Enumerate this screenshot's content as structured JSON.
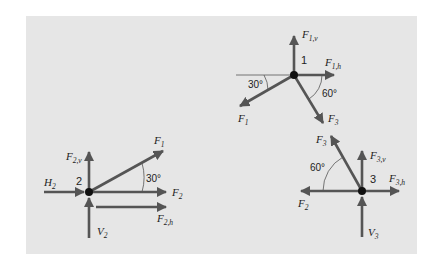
{
  "colors": {
    "background": "#ffffff",
    "panel": "#e6e6e6",
    "arrow": "#555555",
    "node": "#111111",
    "text": "#222222"
  },
  "nodes": [
    {
      "id": "1",
      "label": "1"
    },
    {
      "id": "2",
      "label": "2"
    },
    {
      "id": "3",
      "label": "3"
    }
  ],
  "node1": {
    "number": "1",
    "forces": {
      "F1v": {
        "main": "F",
        "sub": "1,v"
      },
      "F1h": {
        "main": "F",
        "sub": "1,h"
      },
      "F1": {
        "main": "F",
        "sub": "1"
      },
      "F3": {
        "main": "F",
        "sub": "3"
      }
    },
    "angles": {
      "left": "30°",
      "right": "60°"
    }
  },
  "node2": {
    "number": "2",
    "forces": {
      "F2v": {
        "main": "F",
        "sub": "2,v"
      },
      "H2": {
        "main": "H",
        "sub": "2"
      },
      "F1": {
        "main": "F",
        "sub": "1"
      },
      "F2": {
        "main": "F",
        "sub": "2"
      },
      "F2h": {
        "main": "F",
        "sub": "2,h"
      },
      "V2": {
        "main": "V",
        "sub": "2"
      }
    },
    "angles": {
      "main": "30°"
    }
  },
  "node3": {
    "number": "3",
    "forces": {
      "F3": {
        "main": "F",
        "sub": "3"
      },
      "F3v": {
        "main": "F",
        "sub": "3,v"
      },
      "F3h": {
        "main": "F",
        "sub": "3,h"
      },
      "F2": {
        "main": "F",
        "sub": "2"
      },
      "V3": {
        "main": "V",
        "sub": "3"
      }
    },
    "angles": {
      "main": "60°"
    }
  }
}
